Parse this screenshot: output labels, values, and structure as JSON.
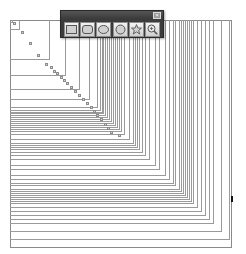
{
  "canvas": {
    "background": "#ffffff",
    "line_color": "#9a9a9a",
    "origin": {
      "x": 10,
      "y": 20
    },
    "frame": {
      "x": 10,
      "y": 20,
      "width": 222,
      "height": 228
    },
    "square_sizes": [
      3,
      10,
      40,
      56,
      70,
      80,
      88,
      91,
      93,
      94,
      96,
      98,
      100,
      102,
      104,
      106,
      108,
      110,
      112,
      115,
      120,
      124,
      126,
      128,
      130,
      133,
      136,
      140,
      146,
      150,
      156,
      160,
      164,
      166,
      170,
      172,
      174,
      176,
      178,
      180,
      182,
      184,
      188,
      192,
      196,
      200,
      204,
      212,
      220
    ],
    "markers": [
      [
        13,
        22
      ],
      [
        21,
        31
      ],
      [
        29,
        42
      ],
      [
        37,
        54
      ],
      [
        45,
        63
      ],
      [
        50,
        66
      ],
      [
        53,
        70
      ],
      [
        56,
        72
      ],
      [
        60,
        76
      ],
      [
        63,
        79
      ],
      [
        66,
        82
      ],
      [
        70,
        86
      ],
      [
        74,
        90
      ],
      [
        78,
        94
      ],
      [
        82,
        98
      ],
      [
        86,
        102
      ],
      [
        90,
        106
      ],
      [
        93,
        110
      ],
      [
        96,
        114
      ],
      [
        100,
        118
      ],
      [
        104,
        123
      ],
      [
        107,
        127
      ],
      [
        110,
        131
      ],
      [
        118,
        134
      ]
    ],
    "edge_mark": {
      "x": 231,
      "y": 196
    }
  },
  "toolbar": {
    "title": "",
    "close_label": "×",
    "tools": [
      {
        "name": "rectangle-tool",
        "icon": "rectangle-icon"
      },
      {
        "name": "rounded-rectangle-tool",
        "icon": "rounded-rectangle-icon"
      },
      {
        "name": "ellipse-tool",
        "icon": "ellipse-icon"
      },
      {
        "name": "circle-tool",
        "icon": "circle-icon"
      },
      {
        "name": "star-tool",
        "icon": "star-icon"
      },
      {
        "name": "zoom-tool",
        "icon": "zoom-icon"
      }
    ]
  }
}
